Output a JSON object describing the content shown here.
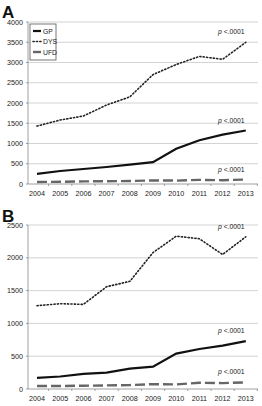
{
  "chart_data": [
    {
      "panel_label": "A",
      "type": "line",
      "title": "",
      "xlabel": "",
      "ylabel": "",
      "categories": [
        "2004",
        "2005",
        "2006",
        "2007",
        "2008",
        "2009",
        "2010",
        "2011",
        "2012",
        "2013"
      ],
      "ylim": [
        0,
        4000
      ],
      "yticks": [
        0,
        500,
        1000,
        1500,
        2000,
        2500,
        3000,
        3500,
        4000
      ],
      "grid": true,
      "legend_position": "upper-left-inside",
      "series": [
        {
          "name": "GP",
          "style": "solid",
          "values": [
            250,
            320,
            370,
            420,
            480,
            540,
            870,
            1080,
            1220,
            1320
          ]
        },
        {
          "name": "DYS",
          "style": "dotted",
          "values": [
            1430,
            1580,
            1680,
            1950,
            2150,
            2700,
            2950,
            3150,
            3080,
            3500
          ]
        },
        {
          "name": "UFD",
          "style": "dashed",
          "values": [
            50,
            55,
            65,
            70,
            75,
            90,
            85,
            100,
            95,
            110
          ]
        }
      ],
      "annotations": [
        {
          "series": "DYS",
          "text": "p <.0001"
        },
        {
          "series": "GP",
          "text": "p <.0001"
        },
        {
          "series": "UFD",
          "text": "p <.0001"
        }
      ]
    },
    {
      "panel_label": "B",
      "type": "line",
      "title": "",
      "xlabel": "",
      "ylabel": "",
      "categories": [
        "2004",
        "2005",
        "2006",
        "2007",
        "2008",
        "2009",
        "2010",
        "2011",
        "2012",
        "2013"
      ],
      "ylim": [
        0,
        2500
      ],
      "yticks": [
        0,
        500,
        1000,
        1500,
        2000,
        2500
      ],
      "grid": true,
      "legend_position": "none",
      "series": [
        {
          "name": "GP",
          "style": "solid",
          "values": [
            170,
            190,
            230,
            250,
            310,
            340,
            540,
            610,
            660,
            730
          ]
        },
        {
          "name": "DYS",
          "style": "dotted",
          "values": [
            1270,
            1300,
            1290,
            1560,
            1640,
            2080,
            2330,
            2290,
            2050,
            2320
          ]
        },
        {
          "name": "UFD",
          "style": "dashed",
          "values": [
            45,
            45,
            50,
            55,
            60,
            75,
            70,
            95,
            90,
            100
          ]
        }
      ],
      "annotations": [
        {
          "series": "DYS",
          "text": "p <.0001"
        },
        {
          "series": "GP",
          "text": "p <.0001"
        },
        {
          "series": "UFD",
          "text": "p <.0001"
        }
      ]
    }
  ],
  "panels": [
    {
      "label": "A",
      "legend": [
        "GP",
        "DYS",
        "UFD"
      ],
      "p_label": "p",
      "p_value": "<.0001"
    },
    {
      "label": "B",
      "p_label": "p",
      "p_value": "<.0001"
    }
  ],
  "colors": {
    "GP": "#111111",
    "DYS": "#222222",
    "UFD": "#666666",
    "grid": "#c8c8c8",
    "axis": "#888888",
    "text": "#222222"
  }
}
